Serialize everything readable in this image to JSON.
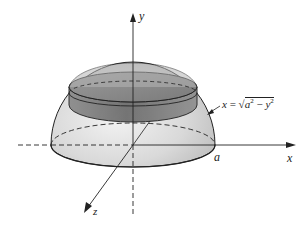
{
  "figure": {
    "axes": {
      "x_label": "x",
      "y_label": "y",
      "z_label": "z"
    },
    "radius_label": "a",
    "equation": {
      "lhs": "x",
      "equals": "=",
      "radicand_a": "a",
      "exp_a": "2",
      "minus": "−",
      "radicand_y": "y",
      "exp_y": "2",
      "text": "x = √(a² − y²)"
    },
    "colors": {
      "stroke": "#222222",
      "dome_fill": "#d8d8d8",
      "band_fill": "#6e6e6e",
      "disk_fill": "#8c8c8c"
    }
  }
}
